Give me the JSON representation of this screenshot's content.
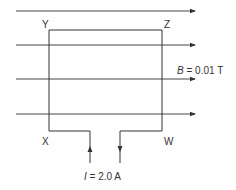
{
  "diagram": {
    "corners": {
      "top_left": "Y",
      "top_right": "Z",
      "bottom_left": "X",
      "bottom_right": "W"
    },
    "field": {
      "symbol": "B",
      "equals": " = 0.01 T"
    },
    "current": {
      "symbol": "I",
      "equals": " = 2.0 A"
    },
    "colors": {
      "line": "#333333",
      "background": "#ffffff"
    }
  }
}
